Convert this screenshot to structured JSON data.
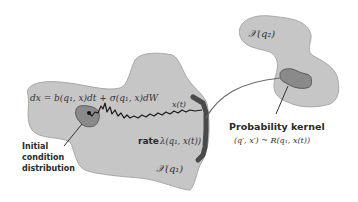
{
  "diagram": {
    "regions": [
      {
        "id": "region-q1",
        "label": "𝒳(q₁)"
      },
      {
        "id": "region-q2",
        "label": "𝒳(q₂)"
      }
    ],
    "sde_equation": "dx = b(q₁, x)dt + σ(q₁, x)dW",
    "trajectory_label": "x(t)",
    "rate_label_prefix": "rate",
    "rate_label_math": "λ(q₁, x(t))",
    "initial_condition_label": [
      "Initial",
      "condition",
      "distribution"
    ],
    "kernel_label": "Probability kernel",
    "kernel_math": "(q′, x′) ~ R(q₁, x(t))",
    "colors": {
      "region_fill": "#c6c6c6",
      "region_stroke": "#a8a8a8",
      "distribution_fill": "#8a8a8a",
      "distribution_stroke": "#5a5a5a",
      "guard_boundary": "#4a4a4a",
      "trajectory": "#1a1a1a",
      "arrow": "#6a6a6a"
    }
  }
}
